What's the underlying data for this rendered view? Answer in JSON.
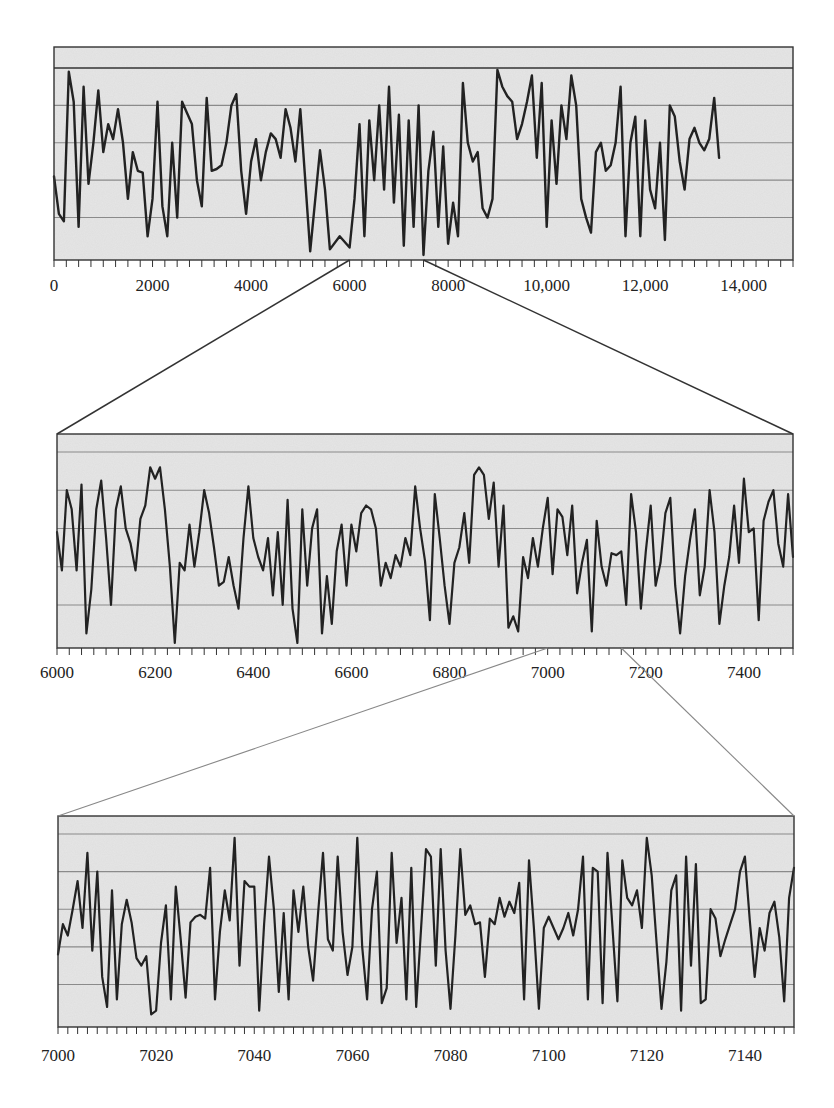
{
  "figure": {
    "colors": {
      "plot_background": "#e6e6e6",
      "line": "#222222",
      "gridline": "#8a8a8a",
      "frame": "#333333",
      "connector_dark": "#333333",
      "connector_light": "#888888"
    }
  },
  "chart_data": [
    {
      "type": "line",
      "title": "",
      "xlabel": "",
      "ylabel": "",
      "xlim": [
        0,
        15000
      ],
      "grid": "horizontal",
      "legend": "none",
      "tick_labels": [
        "0",
        "2000",
        "4000",
        "6000",
        "8000",
        "10,000",
        "12,000",
        "14,000"
      ],
      "tick_values": [
        0,
        2000,
        4000,
        6000,
        8000,
        10000,
        12000,
        14000
      ],
      "minor_tick_step": 250,
      "zoom_region": [
        6000,
        7500
      ],
      "x": [
        0,
        100,
        200,
        300,
        400,
        500,
        600,
        700,
        800,
        900,
        1000,
        1100,
        1200,
        1300,
        1400,
        1500,
        1600,
        1700,
        1800,
        1900,
        2000,
        2100,
        2200,
        2300,
        2400,
        2500,
        2600,
        2700,
        2800,
        2900,
        3000,
        3100,
        3200,
        3300,
        3400,
        3500,
        3600,
        3700,
        3800,
        3900,
        4000,
        4100,
        4200,
        4300,
        4400,
        4500,
        4600,
        4700,
        4800,
        4900,
        5000,
        5200,
        5400,
        5500,
        5600,
        5800,
        6000,
        6100,
        6200,
        6300,
        6400,
        6500,
        6600,
        6700,
        6800,
        6900,
        7000,
        7100,
        7200,
        7300,
        7400,
        7500,
        7600,
        7700,
        7800,
        7900,
        8000,
        8100,
        8200,
        8300,
        8400,
        8500,
        8600,
        8700,
        8800,
        8900,
        9000,
        9100,
        9200,
        9300,
        9400,
        9500,
        9600,
        9700,
        9800,
        9900,
        10000,
        10100,
        10200,
        10300,
        10400,
        10500,
        10600,
        10700,
        10800,
        10900,
        11000,
        11100,
        11200,
        11300,
        11400,
        11500,
        11600,
        11700,
        11800,
        11900,
        12000,
        12100,
        12200,
        12300,
        12400,
        12500,
        12600,
        12700,
        12800,
        12900,
        13000,
        13100,
        13200,
        13300,
        13400,
        13500,
        13600,
        13700,
        13800,
        13900,
        14000,
        14100,
        14200,
        14300,
        14400,
        14500,
        14600,
        14700,
        14800,
        14900,
        15000
      ],
      "values": [
        0.42,
        0.22,
        0.18,
        0.98,
        0.82,
        0.15,
        0.9,
        0.38,
        0.6,
        0.88,
        0.55,
        0.7,
        0.62,
        0.78,
        0.6,
        0.3,
        0.55,
        0.45,
        0.44,
        0.1,
        0.3,
        0.82,
        0.26,
        0.1,
        0.6,
        0.2,
        0.82,
        0.76,
        0.7,
        0.4,
        0.26,
        0.84,
        0.45,
        0.46,
        0.48,
        0.6,
        0.8,
        0.86,
        0.45,
        0.22,
        0.5,
        0.62,
        0.4,
        0.55,
        0.65,
        0.62,
        0.52,
        0.78,
        0.68,
        0.5,
        0.78,
        0.02,
        0.56,
        0.35,
        0.03,
        0.1,
        0.04,
        0.3,
        0.7,
        0.1,
        0.72,
        0.4,
        0.8,
        0.35,
        0.9,
        0.28,
        0.75,
        0.05,
        0.72,
        0.15,
        0.8,
        0.0,
        0.45,
        0.66,
        0.15,
        0.58,
        0.06,
        0.28,
        0.1,
        0.92,
        0.6,
        0.5,
        0.55,
        0.25,
        0.2,
        0.3,
        0.99,
        0.9,
        0.85,
        0.82,
        0.62,
        0.7,
        0.82,
        0.96,
        0.52,
        0.92,
        0.15,
        0.72,
        0.38,
        0.8,
        0.62,
        0.96,
        0.8,
        0.3,
        0.2,
        0.12,
        0.55,
        0.6,
        0.45,
        0.48,
        0.6,
        0.9,
        0.1,
        0.6,
        0.74,
        0.1,
        0.72,
        0.35,
        0.25,
        0.6,
        0.08,
        0.8,
        0.74,
        0.5,
        0.35,
        0.62,
        0.68,
        0.6,
        0.56,
        0.62,
        0.84,
        0.52
      ],
      "ylim": [
        0,
        1
      ]
    },
    {
      "type": "line",
      "title": "",
      "xlabel": "",
      "ylabel": "",
      "xlim": [
        6000,
        7500
      ],
      "grid": "horizontal",
      "legend": "none",
      "tick_labels": [
        "6000",
        "6200",
        "6400",
        "6600",
        "6800",
        "7000",
        "7200",
        "7400"
      ],
      "tick_values": [
        6000,
        6200,
        6400,
        6600,
        6800,
        7000,
        7200,
        7400
      ],
      "minor_tick_step": 25,
      "zoom_region": [
        7000,
        7150
      ],
      "x": [
        6000,
        6010,
        6020,
        6030,
        6040,
        6050,
        6060,
        6070,
        6080,
        6090,
        6100,
        6110,
        6120,
        6130,
        6140,
        6150,
        6160,
        6170,
        6180,
        6190,
        6200,
        6210,
        6220,
        6230,
        6240,
        6250,
        6260,
        6270,
        6280,
        6290,
        6300,
        6310,
        6320,
        6330,
        6340,
        6350,
        6360,
        6370,
        6380,
        6390,
        6400,
        6410,
        6420,
        6430,
        6440,
        6450,
        6460,
        6470,
        6480,
        6490,
        6500,
        6510,
        6520,
        6530,
        6540,
        6550,
        6560,
        6570,
        6580,
        6590,
        6600,
        6610,
        6620,
        6630,
        6640,
        6650,
        6660,
        6670,
        6680,
        6690,
        6700,
        6710,
        6720,
        6730,
        6740,
        6750,
        6760,
        6770,
        6780,
        6790,
        6800,
        6810,
        6820,
        6830,
        6840,
        6850,
        6860,
        6870,
        6880,
        6890,
        6900,
        6910,
        6920,
        6930,
        6940,
        6950,
        6960,
        6970,
        6980,
        6990,
        7000,
        7010,
        7020,
        7030,
        7040,
        7050,
        7060,
        7070,
        7080,
        7090,
        7100,
        7110,
        7120,
        7130,
        7140,
        7150,
        7160,
        7170,
        7180,
        7190,
        7200,
        7210,
        7220,
        7230,
        7240,
        7250,
        7260,
        7270,
        7280,
        7290,
        7300,
        7310,
        7320,
        7330,
        7340,
        7350,
        7360,
        7370,
        7380,
        7390,
        7400,
        7410,
        7420,
        7430,
        7440,
        7450,
        7460,
        7470,
        7480,
        7490,
        7500
      ],
      "values": [
        0.58,
        0.38,
        0.8,
        0.7,
        0.38,
        0.83,
        0.05,
        0.28,
        0.7,
        0.85,
        0.55,
        0.2,
        0.7,
        0.82,
        0.6,
        0.52,
        0.38,
        0.65,
        0.72,
        0.92,
        0.86,
        0.92,
        0.7,
        0.4,
        0.0,
        0.42,
        0.38,
        0.62,
        0.4,
        0.58,
        0.8,
        0.68,
        0.5,
        0.3,
        0.32,
        0.45,
        0.3,
        0.18,
        0.55,
        0.82,
        0.55,
        0.45,
        0.38,
        0.55,
        0.25,
        0.58,
        0.2,
        0.75,
        0.18,
        0.0,
        0.7,
        0.3,
        0.6,
        0.7,
        0.05,
        0.35,
        0.1,
        0.48,
        0.62,
        0.3,
        0.62,
        0.48,
        0.68,
        0.72,
        0.7,
        0.6,
        0.3,
        0.42,
        0.34,
        0.46,
        0.4,
        0.55,
        0.46,
        0.82,
        0.6,
        0.43,
        0.12,
        0.78,
        0.55,
        0.3,
        0.1,
        0.42,
        0.5,
        0.68,
        0.42,
        0.88,
        0.92,
        0.88,
        0.65,
        0.84,
        0.4,
        0.72,
        0.08,
        0.14,
        0.06,
        0.45,
        0.34,
        0.55,
        0.4,
        0.6,
        0.76,
        0.36,
        0.7,
        0.66,
        0.46,
        0.72,
        0.26,
        0.42,
        0.54,
        0.06,
        0.64,
        0.4,
        0.3,
        0.47,
        0.46,
        0.48,
        0.2,
        0.78,
        0.58,
        0.18,
        0.48,
        0.72,
        0.3,
        0.42,
        0.68,
        0.76,
        0.3,
        0.05,
        0.35,
        0.54,
        0.7,
        0.25,
        0.4,
        0.8,
        0.58,
        0.1,
        0.3,
        0.45,
        0.72,
        0.42,
        0.86,
        0.58,
        0.6,
        0.12,
        0.64,
        0.74,
        0.8,
        0.52,
        0.4,
        0.78,
        0.45
      ],
      "ylim": [
        0,
        1
      ]
    },
    {
      "type": "line",
      "title": "",
      "xlabel": "",
      "ylabel": "",
      "xlim": [
        7000,
        7150
      ],
      "grid": "horizontal",
      "legend": "none",
      "tick_labels": [
        "7000",
        "7020",
        "7040",
        "7060",
        "7080",
        "7100",
        "7120",
        "7140"
      ],
      "tick_values": [
        7000,
        7020,
        7040,
        7060,
        7080,
        7100,
        7120,
        7140
      ],
      "minor_tick_step": 2,
      "x": [
        7000,
        7001,
        7002,
        7003,
        7004,
        7005,
        7006,
        7007,
        7008,
        7009,
        7010,
        7011,
        7012,
        7013,
        7014,
        7015,
        7016,
        7017,
        7018,
        7019,
        7020,
        7021,
        7022,
        7023,
        7024,
        7025,
        7026,
        7027,
        7028,
        7029,
        7030,
        7031,
        7032,
        7033,
        7034,
        7035,
        7036,
        7037,
        7038,
        7039,
        7040,
        7041,
        7042,
        7043,
        7044,
        7045,
        7046,
        7047,
        7048,
        7049,
        7050,
        7051,
        7052,
        7053,
        7054,
        7055,
        7056,
        7057,
        7058,
        7059,
        7060,
        7061,
        7062,
        7063,
        7064,
        7065,
        7066,
        7067,
        7068,
        7069,
        7070,
        7071,
        7072,
        7073,
        7074,
        7075,
        7076,
        7077,
        7078,
        7079,
        7080,
        7081,
        7082,
        7083,
        7084,
        7085,
        7086,
        7087,
        7088,
        7089,
        7090,
        7091,
        7092,
        7093,
        7094,
        7095,
        7096,
        7097,
        7098,
        7099,
        7100,
        7101,
        7102,
        7103,
        7104,
        7105,
        7106,
        7107,
        7108,
        7109,
        7110,
        7111,
        7112,
        7113,
        7114,
        7115,
        7116,
        7117,
        7118,
        7119,
        7120,
        7121,
        7122,
        7123,
        7124,
        7125,
        7126,
        7127,
        7128,
        7129,
        7130,
        7131,
        7132,
        7133,
        7134,
        7135,
        7136,
        7137,
        7138,
        7139,
        7140,
        7141,
        7142,
        7143,
        7144,
        7145,
        7146,
        7147,
        7148,
        7149,
        7150
      ],
      "values": [
        0.36,
        0.52,
        0.46,
        0.6,
        0.75,
        0.5,
        0.9,
        0.38,
        0.8,
        0.24,
        0.08,
        0.7,
        0.12,
        0.52,
        0.65,
        0.53,
        0.34,
        0.3,
        0.35,
        0.04,
        0.06,
        0.42,
        0.62,
        0.12,
        0.72,
        0.44,
        0.13,
        0.53,
        0.56,
        0.57,
        0.55,
        0.82,
        0.12,
        0.48,
        0.7,
        0.54,
        0.98,
        0.3,
        0.75,
        0.72,
        0.72,
        0.06,
        0.52,
        0.88,
        0.6,
        0.16,
        0.58,
        0.12,
        0.7,
        0.48,
        0.72,
        0.4,
        0.22,
        0.58,
        0.9,
        0.44,
        0.38,
        0.88,
        0.48,
        0.25,
        0.4,
        0.98,
        0.4,
        0.12,
        0.6,
        0.8,
        0.1,
        0.18,
        0.9,
        0.42,
        0.66,
        0.12,
        0.82,
        0.08,
        0.5,
        0.92,
        0.88,
        0.3,
        0.92,
        0.38,
        0.07,
        0.46,
        0.92,
        0.57,
        0.62,
        0.52,
        0.53,
        0.24,
        0.55,
        0.52,
        0.66,
        0.56,
        0.64,
        0.58,
        0.74,
        0.12,
        0.86,
        0.5,
        0.07,
        0.5,
        0.56,
        0.5,
        0.44,
        0.5,
        0.58,
        0.46,
        0.6,
        0.88,
        0.12,
        0.82,
        0.8,
        0.1,
        0.9,
        0.5,
        0.11,
        0.86,
        0.66,
        0.62,
        0.7,
        0.5,
        0.98,
        0.78,
        0.42,
        0.07,
        0.32,
        0.7,
        0.78,
        0.06,
        0.88,
        0.3,
        0.84,
        0.1,
        0.12,
        0.6,
        0.55,
        0.35,
        0.44,
        0.52,
        0.6,
        0.8,
        0.88,
        0.54,
        0.24,
        0.5,
        0.38,
        0.58,
        0.64,
        0.45,
        0.11,
        0.66,
        0.82
      ],
      "ylim": [
        0,
        1
      ]
    }
  ]
}
